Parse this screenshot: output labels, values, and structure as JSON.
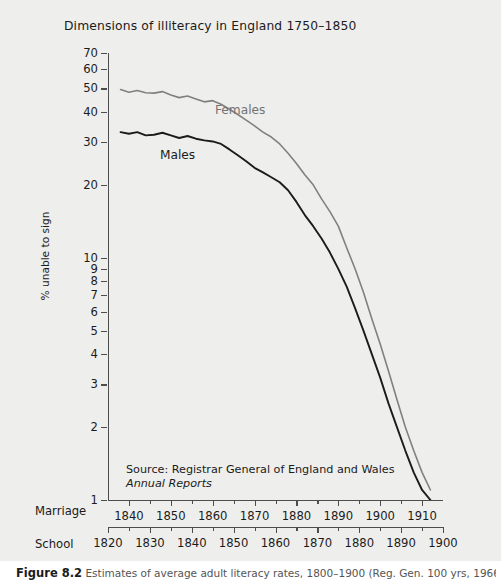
{
  "figure": {
    "title": "Dimensions of illiteracy in England  1750–1850",
    "caption_label": "Figure  8.2",
    "caption_text": "Estimates of average adult literacy rates, 1800–1900 (Reg. Gen. 100 yrs, 1966)",
    "background": "#eeeeec"
  },
  "source": {
    "line1": "Source: Registrar General of England and Wales",
    "line2": "Annual Reports"
  },
  "chart_data": {
    "type": "line",
    "title": "Dimensions of illiteracy in England  1750–1850",
    "xlabel": "Marriage",
    "xlabel_secondary": "School",
    "ylabel": "% unable to sign",
    "yscale": "log",
    "ylim": [
      1,
      70
    ],
    "ytick_labels": [
      70,
      60,
      50,
      40,
      30,
      20,
      10,
      9,
      8,
      7,
      6,
      5,
      4,
      3,
      2,
      1
    ],
    "grid": false,
    "legend_position": "inline-annotation",
    "axes": {
      "marriage": {
        "name": "Marriage",
        "ticks": [
          1840,
          1850,
          1860,
          1870,
          1880,
          1890,
          1900,
          1910
        ],
        "range": [
          1835,
          1915
        ]
      },
      "school": {
        "name": "School",
        "ticks": [
          1820,
          1830,
          1840,
          1850,
          1860,
          1870,
          1880,
          1890,
          1900
        ],
        "range": [
          1820,
          1900
        ]
      }
    },
    "x": [
      1838,
      1840,
      1842,
      1844,
      1846,
      1848,
      1850,
      1852,
      1854,
      1856,
      1858,
      1860,
      1862,
      1864,
      1866,
      1868,
      1870,
      1872,
      1874,
      1876,
      1878,
      1880,
      1882,
      1884,
      1886,
      1888,
      1890,
      1892,
      1894,
      1896,
      1898,
      1900,
      1902,
      1904,
      1906,
      1908,
      1910,
      1912
    ],
    "series": [
      {
        "name": "Females",
        "color": "#808080",
        "values": [
          49.5,
          48.2,
          49.0,
          48.0,
          47.8,
          48.5,
          47.0,
          45.8,
          46.5,
          45.2,
          44.0,
          44.5,
          43.0,
          41.0,
          39.0,
          37.0,
          35.0,
          33.0,
          31.5,
          29.5,
          27.0,
          24.5,
          22.0,
          20.0,
          17.5,
          15.5,
          13.5,
          11.0,
          9.0,
          7.2,
          5.6,
          4.4,
          3.4,
          2.6,
          2.0,
          1.6,
          1.3,
          1.1
        ]
      },
      {
        "name": "Males",
        "color": "#1b1b1b",
        "values": [
          33.0,
          32.5,
          33.0,
          32.0,
          32.2,
          32.8,
          32.0,
          31.2,
          31.8,
          31.0,
          30.5,
          30.2,
          29.5,
          28.0,
          26.5,
          25.0,
          23.5,
          22.5,
          21.5,
          20.5,
          19.0,
          17.0,
          15.0,
          13.5,
          12.0,
          10.5,
          9.0,
          7.6,
          6.2,
          5.0,
          4.0,
          3.2,
          2.5,
          2.0,
          1.6,
          1.3,
          1.1,
          1.0
        ]
      }
    ]
  }
}
